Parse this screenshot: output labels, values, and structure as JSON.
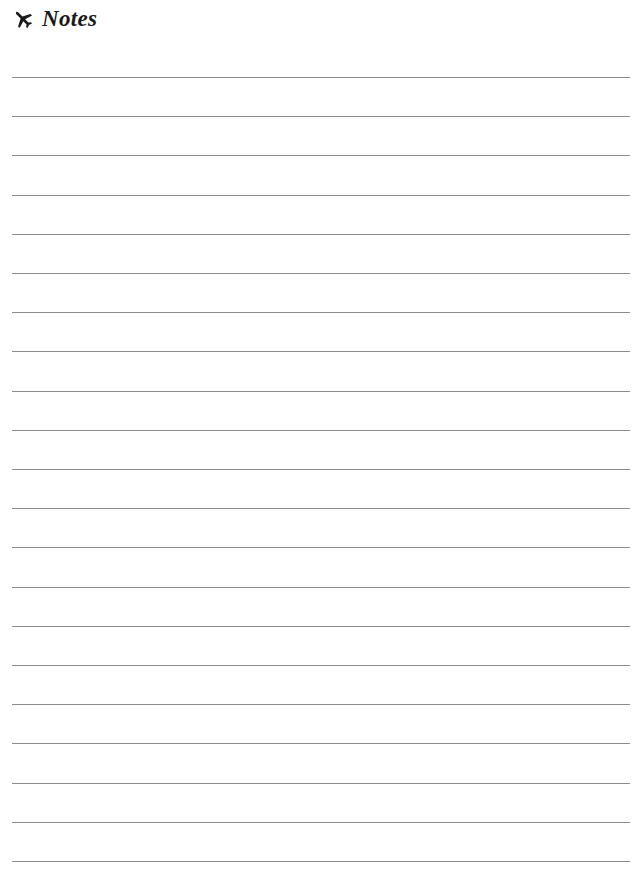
{
  "header": {
    "icon": "airplane-icon",
    "title": "Notes"
  },
  "page": {
    "line_count": 21,
    "first_line_y": 77,
    "line_spacing": 39.2,
    "line_color": "#8c8c8c",
    "lines": [
      "",
      "",
      "",
      "",
      "",
      "",
      "",
      "",
      "",
      "",
      "",
      "",
      "",
      "",
      "",
      "",
      "",
      "",
      "",
      "",
      ""
    ]
  }
}
